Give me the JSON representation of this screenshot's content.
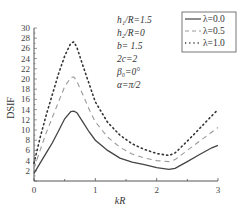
{
  "chart_data": {
    "type": "line",
    "title": "",
    "xlabel": "kR",
    "ylabel": "DSIF",
    "xlim": [
      0,
      3
    ],
    "ylim": [
      0,
      30
    ],
    "xticks": [
      "0",
      "1",
      "2",
      "3"
    ],
    "yticks": [
      "2",
      "4",
      "6",
      "8",
      "10",
      "12",
      "14",
      "16",
      "18",
      "20",
      "22",
      "24",
      "26",
      "28",
      "30"
    ],
    "grid": false,
    "legend_position": "upper right",
    "annotations": [
      "h1/R=1.5",
      "h2/R=0",
      "b=1.5",
      "2c=2",
      "β0=0°",
      "α=π/2"
    ],
    "x": [
      0,
      0.1,
      0.2,
      0.3,
      0.4,
      0.5,
      0.6,
      0.65,
      0.7,
      0.8,
      0.9,
      1.0,
      1.2,
      1.4,
      1.6,
      1.8,
      2.0,
      2.2,
      2.3,
      2.5,
      2.7,
      2.9,
      3.0
    ],
    "series": [
      {
        "name": "λ=0.0",
        "style": "solid",
        "color": "#444444",
        "values": [
          1.5,
          3.5,
          5.5,
          7.5,
          9.8,
          12.2,
          13.6,
          13.7,
          13.4,
          11.5,
          9.6,
          8.0,
          6.0,
          4.5,
          3.7,
          3.2,
          2.6,
          2.3,
          2.5,
          3.8,
          5.2,
          6.5,
          7.0
        ]
      },
      {
        "name": "λ=0.5",
        "style": "dashed",
        "color": "#999999",
        "values": [
          2.5,
          6.0,
          9.5,
          12.5,
          15.5,
          18.5,
          20.3,
          20.4,
          19.5,
          16.8,
          14.0,
          11.6,
          8.6,
          6.6,
          5.3,
          4.5,
          4.0,
          3.8,
          4.2,
          6.0,
          7.8,
          9.6,
          10.5
        ]
      },
      {
        "name": "λ=1.0",
        "style": "dotted",
        "color": "#333333",
        "values": [
          3.5,
          8.5,
          13.0,
          17.0,
          21.0,
          24.5,
          27.0,
          27.3,
          26.2,
          22.5,
          19.0,
          15.5,
          11.5,
          9.0,
          7.3,
          6.2,
          5.4,
          5.0,
          5.5,
          7.8,
          10.3,
          12.8,
          14.0
        ]
      }
    ]
  },
  "params": {
    "p1": "h₁/R=1.5",
    "p2": "h₂/R=0",
    "p3": "b= 1.5",
    "p4": "2c=2",
    "p5": "β₀=0°",
    "p6": "α=π/2"
  },
  "legend": [
    "λ=0.0",
    "λ=0.5",
    "λ=1.0"
  ],
  "axes": {
    "xlabel": "kR",
    "ylabel": "DSIF"
  }
}
